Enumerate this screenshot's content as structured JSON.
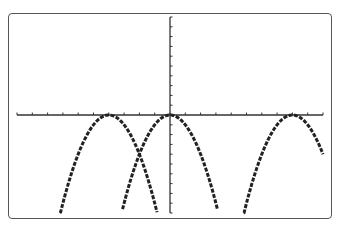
{
  "chart_data": {
    "type": "line",
    "title": "",
    "xlabel": "",
    "ylabel": "",
    "xlim": [
      -10,
      10
    ],
    "ylim": [
      -10,
      10
    ],
    "xscale_tick": 1,
    "yscale_tick": 1,
    "grid": false,
    "legend": null,
    "style": "graphing-calculator pixel plot",
    "series": [
      {
        "name": "y = -(x+4)^2",
        "vertex": [
          -4,
          0
        ],
        "x_range": [
          -7.2,
          -0.85
        ]
      },
      {
        "name": "y = -x^2",
        "vertex": [
          0,
          0
        ],
        "x_range": [
          -3.1,
          3.1
        ]
      },
      {
        "name": "y = -(x-8)^2",
        "vertex": [
          8,
          0
        ],
        "x_range": [
          4.8,
          10
        ]
      }
    ],
    "annotations": [
      {
        "type": "intersection",
        "x": -2,
        "y": -4
      }
    ]
  },
  "colors": {
    "curve": "#222222",
    "axis": "#333333",
    "frame": "#555555",
    "background": "#ffffff"
  }
}
